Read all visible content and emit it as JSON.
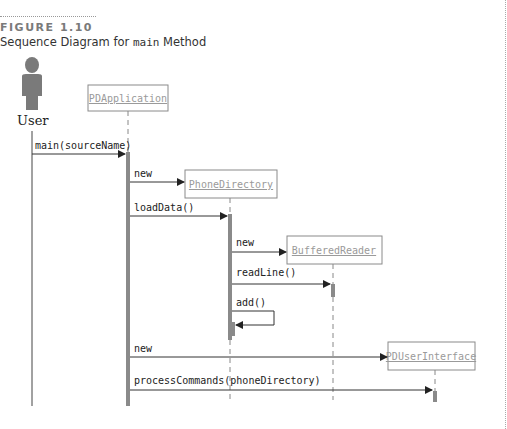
{
  "figure": {
    "label": "FIGURE 1.10",
    "caption_before": "Sequence Diagram for ",
    "caption_code": "main",
    "caption_after": " Method"
  },
  "actor": {
    "name": "User",
    "icon": "person-icon"
  },
  "objects": [
    {
      "id": "pdapp",
      "name": "PDApplication"
    },
    {
      "id": "phonedir",
      "name": "PhoneDirectory"
    },
    {
      "id": "reader",
      "name": "BufferedReader"
    },
    {
      "id": "ui",
      "name": "PDUserInterface"
    }
  ],
  "messages": [
    {
      "label": "main(sourceName)",
      "from": "User",
      "to": "PDApplication"
    },
    {
      "label": "new",
      "from": "PDApplication",
      "to": "PhoneDirectory"
    },
    {
      "label": "loadData()",
      "from": "PDApplication",
      "to": "PhoneDirectory"
    },
    {
      "label": "new",
      "from": "PhoneDirectory",
      "to": "BufferedReader"
    },
    {
      "label": "readLine()",
      "from": "PhoneDirectory",
      "to": "BufferedReader"
    },
    {
      "label": "add()",
      "from": "PhoneDirectory",
      "to": "PhoneDirectory"
    },
    {
      "label": "new",
      "from": "PDApplication",
      "to": "PDUserInterface"
    },
    {
      "label": "processCommands(phoneDirectory)",
      "from": "PDApplication",
      "to": "PDUserInterface"
    }
  ],
  "colors": {
    "activation": "#8a8a8a",
    "box_border": "#8a8a8a",
    "object_text": "#9a9a9a",
    "line": "#333333",
    "actor": "#7a7a7a"
  }
}
